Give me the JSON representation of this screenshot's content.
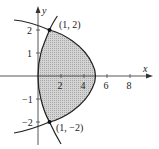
{
  "figure": {
    "type": "region-between-curves",
    "axes": {
      "x_label": "x",
      "y_label": "y",
      "x_ticks": [
        "2",
        "4",
        "6",
        "8"
      ],
      "y_ticks": [
        "2",
        "1",
        "−1",
        "−2"
      ]
    },
    "curves": [
      {
        "name": "left-parabola",
        "equation": "x = y^2/4"
      },
      {
        "name": "right-parabola",
        "equation": "x = 5 - y^2"
      }
    ],
    "points": [
      {
        "label": "(1, 2)",
        "x": 1,
        "y": 2
      },
      {
        "label": "(1, −2)",
        "x": 1,
        "y": -2
      }
    ],
    "shaded_region": {
      "fill": "#c8c8c8",
      "description": "region between the two curves from y=-2 to y=2"
    },
    "colors": {
      "curve": "#222222",
      "axis": "#444444",
      "shade": "#c8c8c8"
    }
  }
}
